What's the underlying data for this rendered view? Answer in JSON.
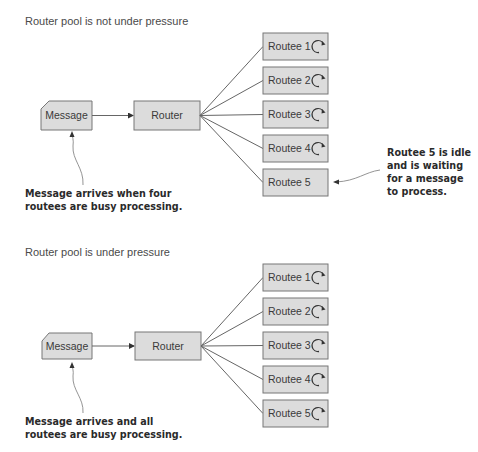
{
  "colors": {
    "box_fill": "#dcdcdc",
    "box_stroke": "#777777",
    "text": "#3a3a3a",
    "note_text": "#2a2a2a"
  },
  "panels": [
    {
      "title": "Router pool is not under pressure",
      "message_label": "Message",
      "router_label": "Router",
      "routees": [
        {
          "label": "Routee 1",
          "busy": true,
          "icon": "busy-spinner-icon"
        },
        {
          "label": "Routee 2",
          "busy": true,
          "icon": "busy-spinner-icon"
        },
        {
          "label": "Routee 3",
          "busy": true,
          "icon": "busy-spinner-icon"
        },
        {
          "label": "Routee 4",
          "busy": true,
          "icon": "busy-spinner-icon"
        },
        {
          "label": "Routee 5",
          "busy": false,
          "icon": ""
        }
      ],
      "message_note": [
        "Message arrives when four",
        "routees are busy processing."
      ],
      "routee_note": [
        "Routee 5 is idle",
        "and is waiting",
        "for a message",
        "to process."
      ]
    },
    {
      "title": "Router pool is under pressure",
      "message_label": "Message",
      "router_label": "Router",
      "routees": [
        {
          "label": "Routee 1",
          "busy": true,
          "icon": "busy-spinner-icon"
        },
        {
          "label": "Routee 2",
          "busy": true,
          "icon": "busy-spinner-icon"
        },
        {
          "label": "Routee 3",
          "busy": true,
          "icon": "busy-spinner-icon"
        },
        {
          "label": "Routee 4",
          "busy": true,
          "icon": "busy-spinner-icon"
        },
        {
          "label": "Routee 5",
          "busy": true,
          "icon": "busy-spinner-icon"
        }
      ],
      "message_note": [
        "Message arrives and all",
        "routees are busy processing."
      ],
      "routee_note": []
    }
  ]
}
